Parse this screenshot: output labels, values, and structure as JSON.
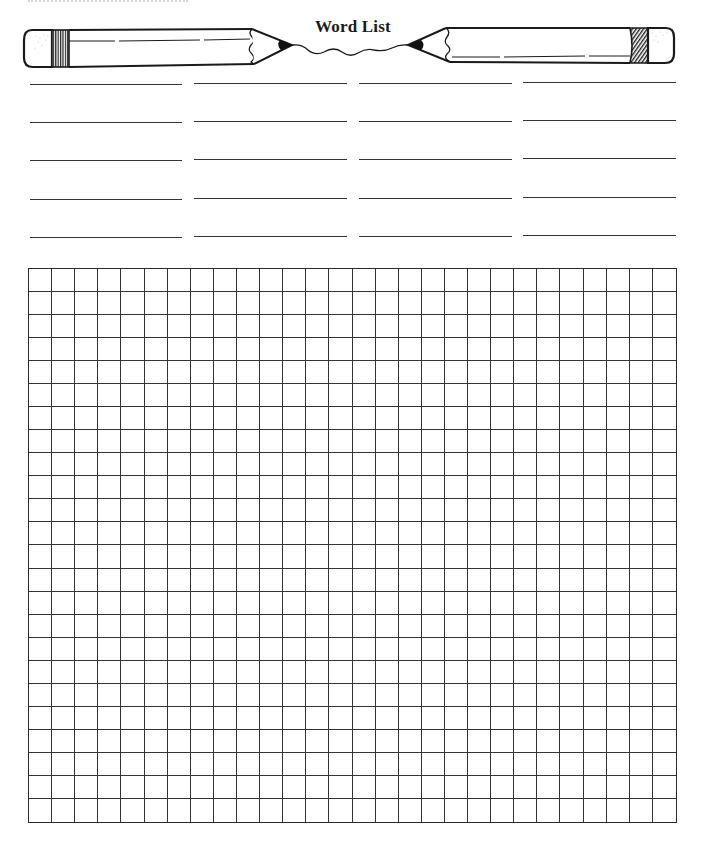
{
  "page": {
    "title": "Word List",
    "background": "#ffffff",
    "ink_color": "#1a1a1a"
  },
  "word_list": {
    "columns": 4,
    "rows": 5,
    "column_x": [
      [
        30,
        182
      ],
      [
        194,
        347
      ],
      [
        359,
        512
      ],
      [
        523,
        676
      ]
    ],
    "row_y": [
      84,
      122,
      160,
      199,
      237
    ],
    "entries": [
      "",
      "",
      "",
      "",
      "",
      "",
      "",
      "",
      "",
      "",
      "",
      "",
      "",
      "",
      "",
      "",
      "",
      "",
      "",
      ""
    ]
  },
  "grid": {
    "columns": 28,
    "rows": 24,
    "left": 28,
    "top": 268,
    "width": 649,
    "height": 555,
    "letters": []
  },
  "decorations": {
    "left_pencil": "pencil-pointing-right",
    "right_pencil": "pencil-pointing-left",
    "connector": "wavy-line-between-pencil-tips"
  }
}
